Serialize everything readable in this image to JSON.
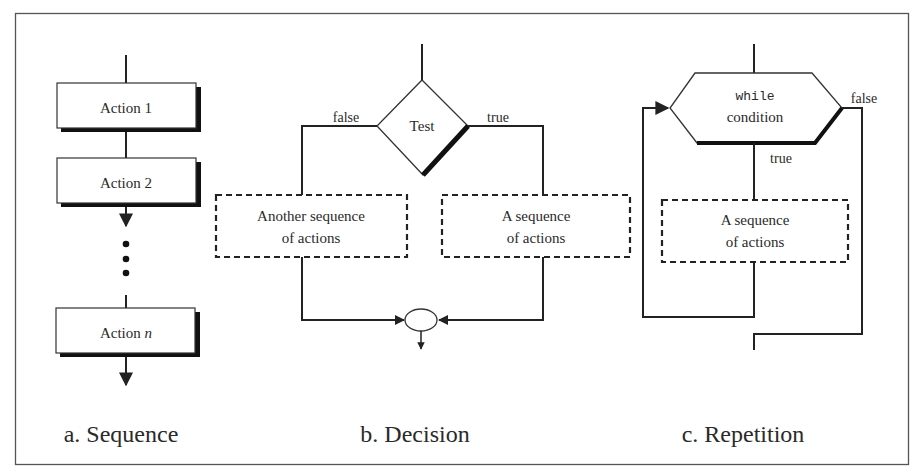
{
  "figure": {
    "panels": [
      {
        "id": "sequence",
        "caption": "a. Sequence",
        "actions": [
          {
            "label_prefix": "Action",
            "label_suffix": "1",
            "suffix_italic": false
          },
          {
            "label_prefix": "Action",
            "label_suffix": "2",
            "suffix_italic": false
          },
          {
            "label_prefix": "Action",
            "label_suffix": "n",
            "suffix_italic": true
          }
        ],
        "ellipsis": "⋮"
      },
      {
        "id": "decision",
        "caption": "b. Decision",
        "test_label": "Test",
        "false_label": "false",
        "true_label": "true",
        "false_branch": {
          "line1": "Another sequence",
          "line2": "of actions"
        },
        "true_branch": {
          "line1": "A sequence",
          "line2": "of actions"
        }
      },
      {
        "id": "repetition",
        "caption": "c. Repetition",
        "keyword": "while",
        "condition": "condition",
        "true_label": "true",
        "false_label": "false",
        "body": {
          "line1": "A sequence",
          "line2": "of actions"
        }
      }
    ]
  },
  "colors": {
    "stroke": "#222222",
    "text": "#2a2a2a",
    "background": "#ffffff",
    "frame": "#555555"
  }
}
